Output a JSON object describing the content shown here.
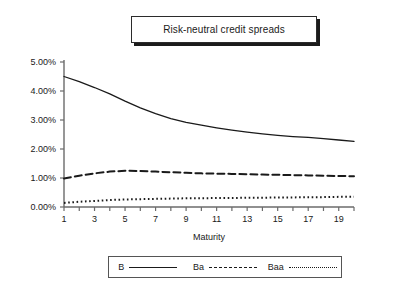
{
  "title": {
    "text": "Risk-neutral credit spreads"
  },
  "legend": {
    "items": [
      {
        "label": "B",
        "style": "solid"
      },
      {
        "label": "Ba",
        "style": "dashed"
      },
      {
        "label": "Baa",
        "style": "dotted"
      }
    ]
  },
  "chart_data": {
    "type": "line",
    "title": "Risk-neutral credit spreads",
    "xlabel": "Maturity",
    "ylabel": "",
    "xlim": [
      1,
      20
    ],
    "ylim": [
      0,
      5
    ],
    "grid": false,
    "legend_position": "bottom",
    "x": [
      1,
      2,
      3,
      4,
      5,
      6,
      7,
      8,
      9,
      10,
      11,
      12,
      13,
      14,
      15,
      16,
      17,
      18,
      19,
      20
    ],
    "xticks": [
      1,
      3,
      5,
      7,
      9,
      11,
      13,
      15,
      17,
      19
    ],
    "xtick_labels": [
      "1",
      "3",
      "5",
      "7",
      "9",
      "11",
      "13",
      "15",
      "17",
      "19"
    ],
    "yticks": [
      0,
      1,
      2,
      3,
      4,
      5
    ],
    "ytick_labels": [
      "0.00%",
      "1.00%",
      "2.00%",
      "3.00%",
      "4.00%",
      "5.00%"
    ],
    "yunit": "percent",
    "series": [
      {
        "name": "B",
        "style": "solid",
        "values": [
          4.5,
          4.32,
          4.12,
          3.9,
          3.65,
          3.42,
          3.22,
          3.05,
          2.92,
          2.82,
          2.73,
          2.65,
          2.58,
          2.52,
          2.47,
          2.43,
          2.4,
          2.36,
          2.31,
          2.26
        ]
      },
      {
        "name": "Ba",
        "style": "dashed",
        "values": [
          0.98,
          1.08,
          1.16,
          1.22,
          1.25,
          1.24,
          1.22,
          1.2,
          1.18,
          1.16,
          1.15,
          1.14,
          1.13,
          1.12,
          1.11,
          1.1,
          1.09,
          1.08,
          1.07,
          1.06
        ]
      },
      {
        "name": "Baa",
        "style": "dotted",
        "values": [
          0.14,
          0.18,
          0.21,
          0.24,
          0.26,
          0.27,
          0.28,
          0.29,
          0.3,
          0.3,
          0.31,
          0.31,
          0.32,
          0.32,
          0.33,
          0.33,
          0.34,
          0.34,
          0.35,
          0.35
        ]
      }
    ]
  },
  "axis": {
    "x_title": "Maturity"
  },
  "colors": {
    "line": "#1a1a1a",
    "axis": "#6b6b6b",
    "background": "#ffffff"
  }
}
